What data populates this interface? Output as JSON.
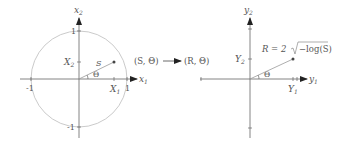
{
  "left_plot": {
    "x_axis_label": "x",
    "x_axis_sub": "1",
    "y_axis_label": "x",
    "y_axis_sub": "2",
    "tick_pos_x": "1",
    "tick_neg_x": "-1",
    "tick_pos_y": "1",
    "tick_neg_y": "-1",
    "point_x_label": "X",
    "point_x_sub": "1",
    "point_y_label": "X",
    "point_y_sub": "2",
    "radius_label": "S",
    "angle_label": "Θ"
  },
  "transform": {
    "from": "(S, Θ)",
    "to": "(R, Θ)"
  },
  "right_plot": {
    "x_axis_label": "y",
    "x_axis_sub": "1",
    "y_axis_label": "y",
    "y_axis_sub": "2",
    "point_x_label": "Y",
    "point_x_sub": "1",
    "point_y_label": "Y",
    "point_y_sub": "2",
    "radius_formula_prefix": "R = 2",
    "radius_formula_radicand": "−log(S)",
    "angle_label": "Θ"
  },
  "colors": {
    "circle": "#b8b8b8",
    "axis": "#666666",
    "text": "#555555"
  }
}
